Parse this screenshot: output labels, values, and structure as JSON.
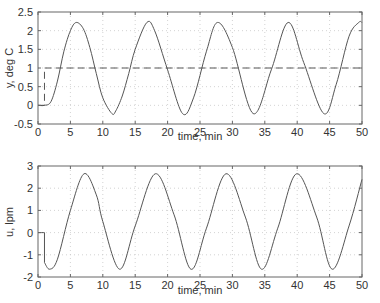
{
  "chart_data": [
    {
      "type": "line",
      "title": "",
      "xlabel": "time, min",
      "ylabel": "y, deg C",
      "xlim": [
        0,
        50
      ],
      "ylim": [
        -0.5,
        2.5
      ],
      "xticks": [
        0,
        5,
        10,
        15,
        20,
        25,
        30,
        35,
        40,
        45,
        50
      ],
      "yticks": [
        -0.5,
        0,
        0.5,
        1,
        1.5,
        2,
        2.5
      ],
      "ytick_labels": [
        "-0.5",
        "0",
        "0.5",
        "1",
        "1.5",
        "2",
        "2.5"
      ],
      "grid": true,
      "legend": null,
      "series": [
        {
          "name": "y (output)",
          "style": "solid",
          "description": "Sustained oscillation after setpoint step at t=1; amplitude ~1.22 about 1.0, period ~10.9 min",
          "x": [
            0,
            1,
            2,
            3,
            4,
            5,
            5.9,
            7,
            8,
            9,
            10,
            11.4,
            12,
            13,
            14,
            15,
            16.8,
            18,
            20,
            22.3,
            24,
            26,
            27.7,
            30,
            33.2,
            36,
            38.6,
            41,
            44.1,
            46,
            48,
            49.5,
            50
          ],
          "values": [
            0,
            0,
            0.1,
            0.65,
            1.45,
            2.0,
            2.22,
            2.05,
            1.55,
            0.85,
            0.2,
            -0.22,
            -0.15,
            0.25,
            0.85,
            1.5,
            2.22,
            2.0,
            0.95,
            -0.22,
            0.2,
            1.45,
            2.22,
            1.55,
            -0.22,
            0.95,
            2.22,
            1.15,
            -0.22,
            0.55,
            1.85,
            2.22,
            2.22
          ]
        },
        {
          "name": "setpoint",
          "style": "dashed",
          "x": [
            0,
            1,
            1,
            50
          ],
          "values": [
            0,
            0,
            1,
            1
          ]
        }
      ]
    },
    {
      "type": "line",
      "title": "",
      "xlabel": "time, min",
      "ylabel": "u, lpm",
      "xlim": [
        0,
        50
      ],
      "ylim": [
        -2,
        3
      ],
      "xticks": [
        0,
        5,
        10,
        15,
        20,
        25,
        30,
        35,
        40,
        45,
        50
      ],
      "yticks": [
        -2,
        -1,
        0,
        1,
        2,
        3
      ],
      "ytick_labels": [
        "-2",
        "-1",
        "0",
        "1",
        "2",
        "3"
      ],
      "grid": true,
      "legend": null,
      "series": [
        {
          "name": "u (controller output)",
          "style": "solid",
          "description": "Step down at t=1 then sustained oscillation; min ~-1.65, max ~2.65, period ~10.9 min",
          "x": [
            0,
            1,
            1,
            1.8,
            3,
            5,
            7.1,
            9,
            10,
            12.6,
            15,
            18.1,
            21,
            23.6,
            26,
            29.0,
            32,
            34.5,
            37,
            39.9,
            43,
            45.4,
            48,
            50
          ],
          "values": [
            0,
            0,
            -1.35,
            -1.65,
            -1.2,
            1.0,
            2.65,
            1.7,
            0.5,
            -1.65,
            0.3,
            2.65,
            0.8,
            -1.65,
            0.2,
            2.65,
            0.7,
            -1.65,
            0.2,
            2.65,
            0.7,
            -1.65,
            0.3,
            2.4
          ]
        }
      ]
    }
  ],
  "plots": {
    "top": {
      "xlabel": "time, min",
      "ylabel": "y, deg C"
    },
    "bottom": {
      "xlabel": "time, min",
      "ylabel": "u, lpm"
    }
  },
  "colors": {
    "curve": "#555555",
    "axis": "#666666",
    "grid": "#c8c8c8",
    "text": "#333333"
  }
}
